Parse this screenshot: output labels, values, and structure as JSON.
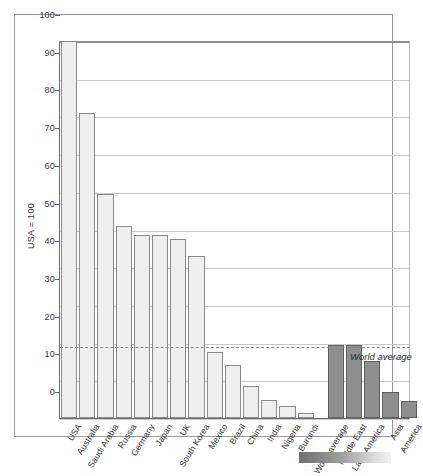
{
  "chart_data": {
    "type": "bar",
    "title": "",
    "subtitle": "",
    "xlabel": "",
    "ylabel": "USA = 100",
    "ylim": [
      0,
      100
    ],
    "yticks": [
      0,
      10,
      20,
      30,
      40,
      50,
      60,
      70,
      80,
      90,
      100
    ],
    "grid": true,
    "legend_position": "none",
    "categories": [
      "USA",
      "Australia",
      "Saudi Arabia",
      "Russia",
      "Germany",
      "Japan",
      "UK",
      "South Korea",
      "Mexico",
      "Brazil",
      "China",
      "India",
      "Nigeria",
      "Burundi",
      "World average",
      "Middle East",
      "Latin America",
      "Asia",
      "America"
    ],
    "values": [
      100,
      81,
      59.5,
      51,
      48.5,
      48.5,
      47.5,
      43,
      17.5,
      14,
      8.5,
      4.8,
      3.2,
      1.3,
      19.3,
      19.3,
      15,
      6.8,
      4.6
    ],
    "series_group": [
      "country",
      "country",
      "country",
      "country",
      "country",
      "country",
      "country",
      "country",
      "country",
      "country",
      "country",
      "country",
      "country",
      "country",
      "region",
      "region",
      "region",
      "region",
      "region"
    ],
    "annotations": [
      {
        "text": "World average",
        "value": 19,
        "style": "dashed-reference-line"
      }
    ],
    "colors": {
      "country_bar_fill": "#efefef",
      "country_bar_stroke": "#8a8a8a",
      "region_bar_fill": "#8e8e8e",
      "region_bar_stroke": "#5f5f5f",
      "gridline": "#c9c9c9",
      "axis": "#6e6e6e"
    }
  }
}
